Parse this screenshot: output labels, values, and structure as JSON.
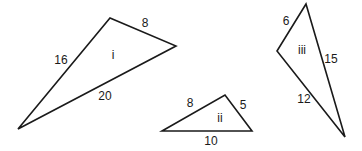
{
  "diagram": {
    "stroke_color": "#1a1a1a",
    "triangles": [
      {
        "id": "i",
        "label": "i",
        "vertices": [
          [
            18,
            129
          ],
          [
            110,
            18
          ],
          [
            176,
            46
          ]
        ],
        "sides": [
          {
            "label": "16",
            "between": "bottom-left to top"
          },
          {
            "label": "8",
            "between": "top to right"
          },
          {
            "label": "20",
            "between": "right to bottom-left"
          }
        ]
      },
      {
        "id": "ii",
        "label": "ii",
        "vertices": [
          [
            162,
            131
          ],
          [
            225,
            95
          ],
          [
            252,
            131
          ]
        ],
        "sides": [
          {
            "label": "8",
            "between": "left to top"
          },
          {
            "label": "5",
            "between": "top to right"
          },
          {
            "label": "10",
            "between": "right to left"
          }
        ]
      },
      {
        "id": "iii",
        "label": "iii",
        "vertices": [
          [
            306,
            4
          ],
          [
            277,
            51
          ],
          [
            345,
            137
          ]
        ],
        "sides": [
          {
            "label": "6",
            "between": "top to left"
          },
          {
            "label": "12",
            "between": "left to bottom"
          },
          {
            "label": "15",
            "between": "bottom to top"
          }
        ]
      }
    ]
  }
}
